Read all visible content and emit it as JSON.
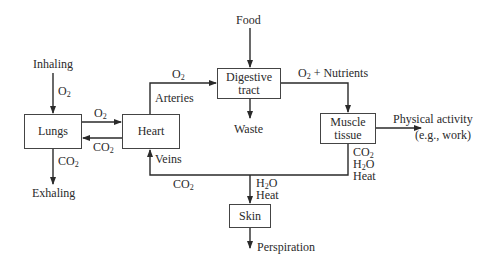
{
  "diagram": {
    "type": "flow",
    "nodes": {
      "lungs": "Lungs",
      "heart": "Heart",
      "digestive": "Digestive tract",
      "digestive_line1": "Digestive",
      "digestive_line2": "tract",
      "muscle_line1": "Muscle",
      "muscle_line2": "tissue",
      "skin": "Skin"
    },
    "terminals": {
      "food": "Food",
      "waste": "Waste",
      "inhaling": "Inhaling",
      "exhaling": "Exhaling",
      "physical_activity": "Physical activity",
      "physical_activity_example": "(e.g., work)",
      "perspiration": "Perspiration"
    },
    "edge_labels": {
      "inhale_o2": "O",
      "lungs_heart_o2": "O",
      "heart_lungs_co2": "CO",
      "exhale_co2": "CO",
      "arteries": "Arteries",
      "arteries_o2": "O",
      "o2_nutrients_prefix": "O",
      "o2_nutrients_suffix": " + Nutrients",
      "veins": "Veins",
      "veins_co2": "CO",
      "muscle_out_co2": "CO",
      "muscle_out_h2o_h": "H",
      "muscle_out_h2o_o": "O",
      "muscle_out_heat": "Heat",
      "skin_in_h2o_h": "H",
      "skin_in_h2o_o": "O",
      "skin_in_heat": "Heat",
      "subscript_2": "2"
    },
    "edges": [
      {
        "from": "Inhaling",
        "to": "Lungs",
        "label": "O2"
      },
      {
        "from": "Lungs",
        "to": "Heart",
        "label": "O2"
      },
      {
        "from": "Heart",
        "to": "Lungs",
        "label": "CO2"
      },
      {
        "from": "Lungs",
        "to": "Exhaling",
        "label": "CO2"
      },
      {
        "from": "Heart",
        "to": "Digestive tract",
        "label": "O2 (Arteries)"
      },
      {
        "from": "Food",
        "to": "Digestive tract"
      },
      {
        "from": "Digestive tract",
        "to": "Waste"
      },
      {
        "from": "Digestive tract",
        "to": "Muscle tissue",
        "label": "O2 + Nutrients"
      },
      {
        "from": "Muscle tissue",
        "to": "Physical activity (e.g., work)"
      },
      {
        "from": "Muscle tissue",
        "to": "Heart",
        "label": "CO2, H2O, Heat / CO2 (Veins)"
      },
      {
        "from": "Muscle tissue",
        "to": "Skin",
        "label": "H2O, Heat"
      },
      {
        "from": "Skin",
        "to": "Perspiration"
      }
    ]
  }
}
